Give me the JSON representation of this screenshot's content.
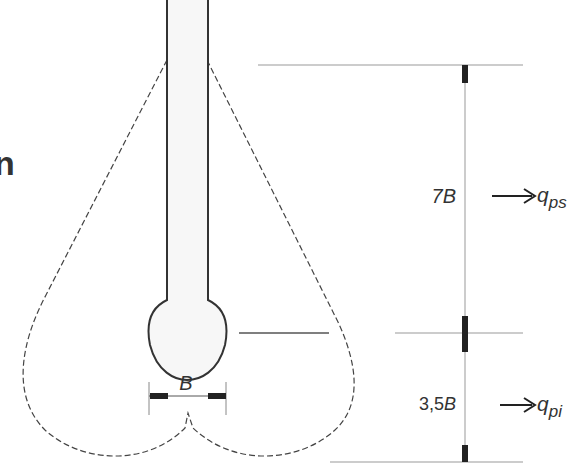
{
  "diagram": {
    "partial_glyph": "n",
    "width_label": "B",
    "dimensions": [
      {
        "label_prefix": "7",
        "label_var": "B",
        "arrow_target": "q",
        "arrow_subscript": "ps",
        "name": "upper-zone"
      },
      {
        "label_prefix": "3,5",
        "label_var": "B",
        "arrow_target": "q",
        "arrow_subscript": "pi",
        "name": "lower-zone"
      }
    ]
  },
  "colors": {
    "stroke": "#333333",
    "dim_line": "#999999",
    "fill_light": "#f7f7f7"
  }
}
